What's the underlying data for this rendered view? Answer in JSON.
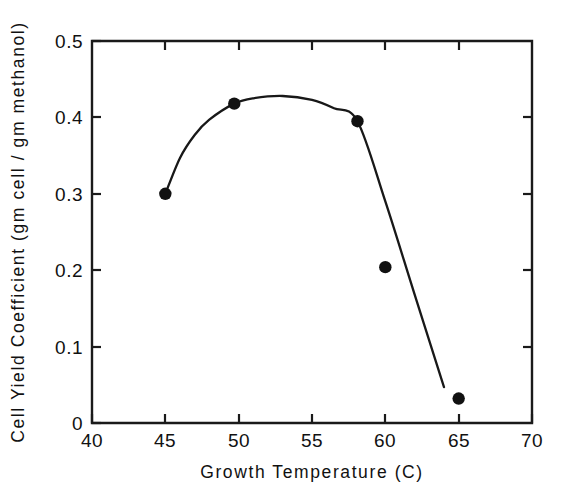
{
  "chart_data": {
    "type": "scatter",
    "title": "",
    "subtitle": "",
    "xlabel": "Growth Temperature  (C)",
    "ylabel": "Cell Yield Coefficient  (gm cell / gm methanol)",
    "xlim": [
      40,
      70
    ],
    "ylim": [
      0,
      0.5
    ],
    "xticks": [
      40,
      45,
      50,
      55,
      60,
      65,
      70
    ],
    "xtick_labels": [
      "40",
      "45",
      "50",
      "55",
      "60",
      "65",
      "70"
    ],
    "yticks": [
      0,
      0.1,
      0.2,
      0.3,
      0.4,
      0.5
    ],
    "ytick_labels": [
      "0",
      "0.1",
      "0.2",
      "0.3",
      "0.4",
      "0.5"
    ],
    "grid": false,
    "legend": null,
    "marker": "filled-circle",
    "marker_color": "#111111",
    "line_color": "#181818",
    "series": [
      {
        "name": "Cell yield coefficient",
        "x": [
          45.0,
          49.7,
          58.1,
          60.0,
          65.0
        ],
        "y": [
          0.3,
          0.418,
          0.395,
          0.204,
          0.032
        ]
      }
    ],
    "fitted_curve": {
      "description": "smooth hump peaking near 53 C then steep near-linear decline",
      "points": [
        [
          45.0,
          0.3
        ],
        [
          46.0,
          0.347
        ],
        [
          47.0,
          0.377
        ],
        [
          48.0,
          0.397
        ],
        [
          49.7,
          0.418
        ],
        [
          51.0,
          0.425
        ],
        [
          53.0,
          0.428
        ],
        [
          55.0,
          0.423
        ],
        [
          56.5,
          0.412
        ],
        [
          58.1,
          0.395
        ],
        [
          60.0,
          0.29
        ],
        [
          62.0,
          0.168
        ],
        [
          64.0,
          0.047
        ]
      ]
    }
  },
  "axis": {
    "x_title": "Growth Temperature  (C)",
    "y_title": "Cell Yield Coefficient  (gm cell / gm methanol)"
  }
}
